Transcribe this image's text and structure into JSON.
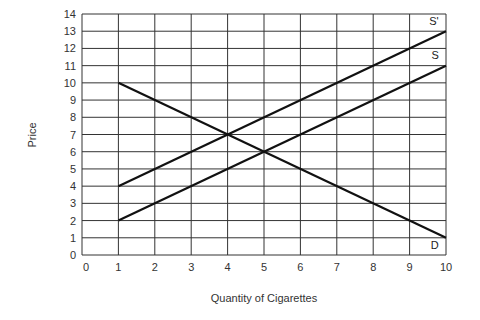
{
  "chart_data": {
    "type": "line",
    "title": "",
    "xlabel": "Quantity of Cigarettes",
    "ylabel": "Price",
    "xlim": [
      0,
      10
    ],
    "ylim": [
      0,
      14
    ],
    "x_ticks": [
      0,
      1,
      2,
      3,
      4,
      5,
      6,
      7,
      8,
      9,
      10
    ],
    "y_ticks": [
      0,
      1,
      2,
      3,
      4,
      5,
      6,
      7,
      8,
      9,
      10,
      11,
      12,
      13,
      14
    ],
    "grid": true,
    "series": [
      {
        "name": "D",
        "x": [
          1,
          10
        ],
        "y": [
          10,
          1
        ]
      },
      {
        "name": "S",
        "x": [
          1,
          10
        ],
        "y": [
          2,
          11
        ]
      },
      {
        "name": "S'",
        "x": [
          1,
          10
        ],
        "y": [
          4,
          13
        ]
      }
    ],
    "annotations": [
      {
        "text": "S'",
        "x": 9.8,
        "y": 13.6
      },
      {
        "text": "S",
        "x": 9.8,
        "y": 11.6
      },
      {
        "text": "D",
        "x": 9.8,
        "y": 0.6
      }
    ]
  },
  "colors": {
    "line": "#111111",
    "grid": "#333333",
    "text": "#333333"
  }
}
